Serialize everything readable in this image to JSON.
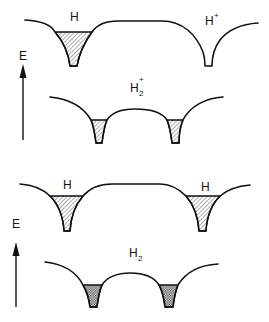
{
  "diagram": {
    "type": "potential-energy-wells",
    "colors": {
      "line": "#111111",
      "background": "#ffffff"
    },
    "panels": [
      {
        "id": "top",
        "axis": {
          "label": "E",
          "direction": "up"
        },
        "upper_system": {
          "wells": [
            {
              "label": "H",
              "superscript": "",
              "subscript": "",
              "fill": "diagonal-hatch"
            },
            {
              "label": "H",
              "superscript": "+",
              "subscript": "",
              "fill": "empty"
            }
          ]
        },
        "lower_system": {
          "label": "H",
          "superscript": "+",
          "subscript": "2",
          "wells": [
            {
              "fill": "diagonal-hatch"
            },
            {
              "fill": "diagonal-hatch"
            }
          ]
        }
      },
      {
        "id": "bottom",
        "axis": {
          "label": "E",
          "direction": "up"
        },
        "upper_system": {
          "wells": [
            {
              "label": "H",
              "superscript": "",
              "subscript": "",
              "fill": "diagonal-hatch"
            },
            {
              "label": "H",
              "superscript": "",
              "subscript": "",
              "fill": "diagonal-hatch"
            }
          ]
        },
        "lower_system": {
          "label": "H",
          "superscript": "",
          "subscript": "2",
          "wells": [
            {
              "fill": "cross-hatch"
            },
            {
              "fill": "cross-hatch"
            }
          ]
        }
      }
    ]
  }
}
